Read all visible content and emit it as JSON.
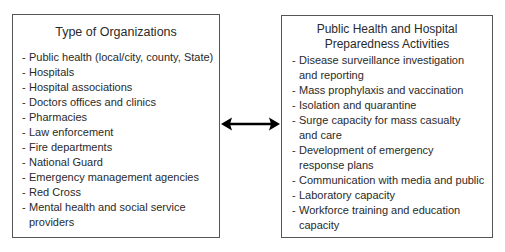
{
  "left_box": {
    "title": "Type of Organizations",
    "items": [
      {
        "line1": "Public health (local/city, county, State)",
        "line2": ""
      },
      {
        "line1": "Hospitals",
        "line2": ""
      },
      {
        "line1": "Hospital associations",
        "line2": ""
      },
      {
        "line1": "Doctors offices and clinics",
        "line2": ""
      },
      {
        "line1": "Pharmacies",
        "line2": ""
      },
      {
        "line1": "Law enforcement",
        "line2": ""
      },
      {
        "line1": "Fire departments",
        "line2": ""
      },
      {
        "line1": "National Guard",
        "line2": ""
      },
      {
        "line1": "Emergency management agencies",
        "line2": ""
      },
      {
        "line1": "Red Cross",
        "line2": ""
      },
      {
        "line1": "Mental health and social service",
        "line2": "providers"
      }
    ]
  },
  "right_box": {
    "title_line1": "Public Health and Hospital",
    "title_line2": "Preparedness Activities",
    "items": [
      {
        "line1": "Disease surveillance investigation",
        "line2": "and reporting"
      },
      {
        "line1": "Mass prophylaxis and vaccination",
        "line2": ""
      },
      {
        "line1": "Isolation and quarantine",
        "line2": ""
      },
      {
        "line1": "Surge capacity for mass casualty",
        "line2": "and care"
      },
      {
        "line1": "Development of emergency",
        "line2": "response plans"
      },
      {
        "line1": "Communication with media and public",
        "line2": ""
      },
      {
        "line1": "Laboratory capacity",
        "line2": ""
      },
      {
        "line1": "Workforce training and education",
        "line2": "capacity"
      }
    ]
  },
  "connector": {
    "type": "bidirectional-arrow"
  },
  "bullet": "-"
}
